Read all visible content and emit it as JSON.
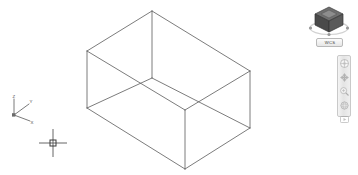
{
  "app": {
    "background_color": "#ffffff",
    "line_color": "#5a5a5a"
  },
  "viewport": {
    "name": "model-space-viewport",
    "model": {
      "type": "wireframe-box",
      "description": "3D rectangular prism (box) shown in isometric wireframe view",
      "projection": "SE isometric",
      "vertices": {
        "top_back": [
          152,
          11
        ],
        "top_left": [
          87,
          51
        ],
        "top_right": [
          250,
          71
        ],
        "top_front": [
          185,
          110
        ],
        "bottom_back": [
          152,
          78
        ],
        "bottom_left": [
          87,
          108
        ],
        "bottom_right": [
          250,
          128
        ],
        "bottom_front": [
          185,
          169
        ]
      },
      "edges": [
        [
          "top_back",
          "top_left"
        ],
        [
          "top_back",
          "top_right"
        ],
        [
          "top_left",
          "top_front"
        ],
        [
          "top_right",
          "top_front"
        ],
        [
          "bottom_back",
          "bottom_left"
        ],
        [
          "bottom_back",
          "bottom_right"
        ],
        [
          "bottom_left",
          "bottom_front"
        ],
        [
          "bottom_right",
          "bottom_front"
        ],
        [
          "top_back",
          "bottom_back"
        ],
        [
          "top_left",
          "bottom_left"
        ],
        [
          "top_right",
          "bottom_right"
        ],
        [
          "top_front",
          "bottom_front"
        ]
      ]
    }
  },
  "ucs_icon": {
    "name": "ucs-axis-icon",
    "axes": [
      {
        "id": "z",
        "label": "Z"
      },
      {
        "id": "y",
        "label": "Y"
      },
      {
        "id": "x",
        "label": "X"
      }
    ]
  },
  "cursor": {
    "name": "crosshair-cursor",
    "x": 53,
    "y": 143
  },
  "viewcube": {
    "name": "view-cube",
    "orientation": "isometric",
    "wcs_label": "WCS"
  },
  "navigation_bar": {
    "name": "navigation-bar",
    "buttons": [
      {
        "id": "steering-wheel",
        "label": "SteeringWheels"
      },
      {
        "id": "pan",
        "label": "Pan"
      },
      {
        "id": "zoom-extents",
        "label": "Zoom Extents"
      },
      {
        "id": "orbit",
        "label": "Orbit"
      },
      {
        "id": "showmotion",
        "label": "ShowMotion"
      }
    ]
  }
}
